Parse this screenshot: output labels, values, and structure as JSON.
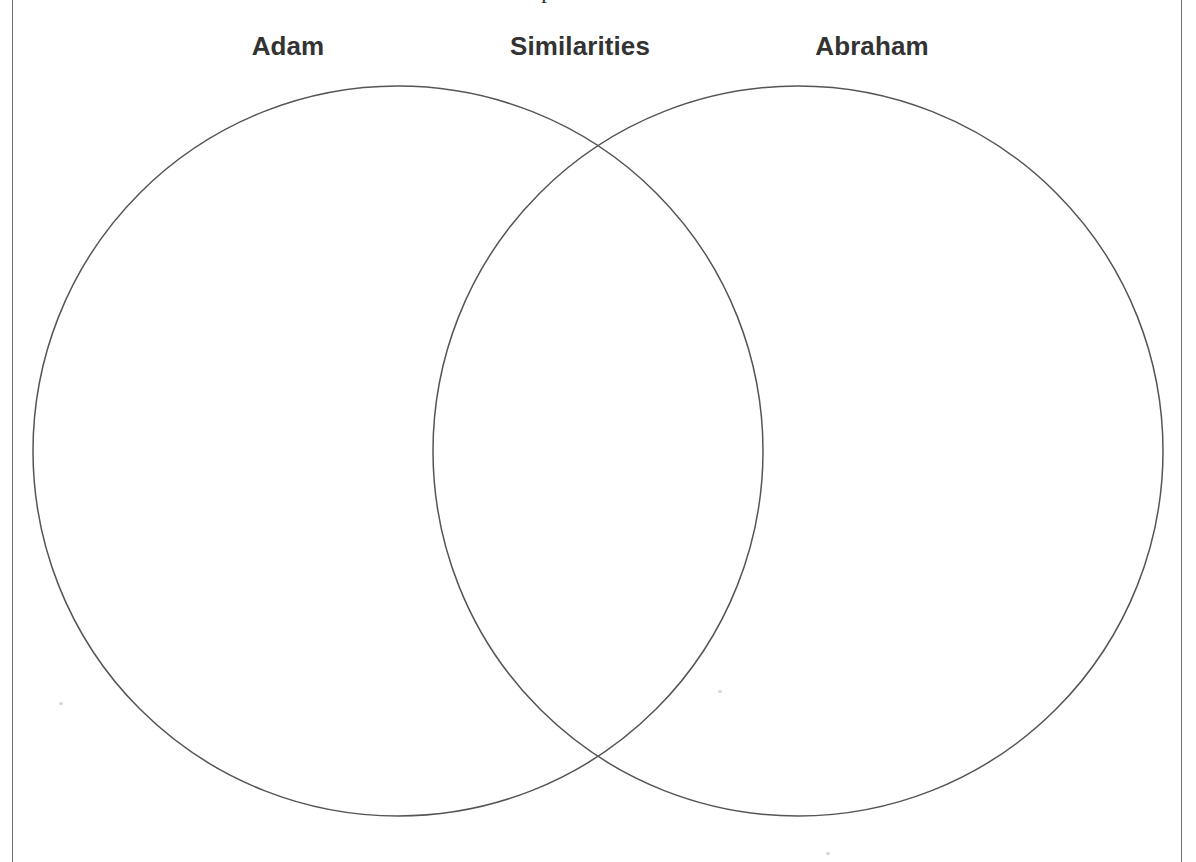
{
  "document": {
    "title_clipped": "Compare and Contrast",
    "background_color": "#ffffff",
    "frame_color": "#6e6e6e"
  },
  "labels": {
    "left": "Adam",
    "center": "Similarities",
    "right": "Abraham",
    "color": "#333333"
  },
  "diagram": {
    "type": "venn",
    "set_count": 2,
    "stroke_color": "#555555",
    "fill": "none",
    "left_circle": {
      "name": "Adam",
      "cx": 398,
      "cy": 451,
      "r": 365
    },
    "right_circle": {
      "name": "Abraham",
      "cx": 798,
      "cy": 451,
      "r": 365
    },
    "intersection_label": "Similarities",
    "intersection_top": {
      "x": 598,
      "y": 150
    },
    "intersection_bottom": {
      "x": 598,
      "y": 763
    },
    "left_only_content": "",
    "overlap_content": "",
    "right_only_content": ""
  }
}
